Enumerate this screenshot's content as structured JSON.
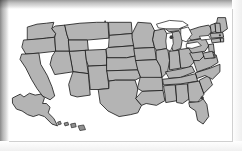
{
  "image": {
    "kind": "raster-map-image",
    "subject": "United States of America political map",
    "alt_text": "Gray map of the United States showing all state boundaries, with Alaska and Hawaii insets",
    "width": 242,
    "height": 151
  },
  "frame": {
    "style": "beveled-gray-shadow-border",
    "shadow_color": "#8a8a8a",
    "canvas_color": "#ffffff"
  },
  "palette": {
    "state_fill": "#b4b4b4",
    "state_border": "#1f1f1f",
    "lake_fill": "#ffffff",
    "island_fill": "#909090",
    "background": "#ffffff",
    "frame_dark": "#8a8a8a",
    "frame_light": "#dedede"
  },
  "map": {
    "title": "",
    "projection_note": "contiguous-48-with-insets",
    "insets": [
      {
        "name": "alaska-inset",
        "label": ""
      },
      {
        "name": "hawaii-inset",
        "label": ""
      }
    ],
    "features": {
      "states_shown": 50,
      "great_lakes_shown": true,
      "labels_shown": false,
      "legend_shown": false,
      "borders_visible": true
    }
  },
  "geometry": {
    "contiguous": [
      {
        "name": "washington",
        "d": "M34,22 L44,19 L54,18 L62,17 L60,24 L64,29 L63,33 L54,34 L44,35 L34,36 Z"
      },
      {
        "name": "oregon",
        "d": "M30,36 L44,35 L54,34 L63,33 L64,48 L46,50 L32,51 L28,44 Z"
      },
      {
        "name": "california",
        "d": "M28,51 L32,51 L46,50 L48,62 L55,74 L60,86 L63,96 L58,100 L50,96 L44,88 L38,78 L32,66 L26,57 Z"
      },
      {
        "name": "idaho",
        "d": "M64,21 L74,20 L76,30 L78,36 L79,48 L64,48 L63,33 L64,29 L60,24 Z"
      },
      {
        "name": "nevada",
        "d": "M64,48 L79,48 L83,70 L63,73 L58,62 L60,54 Z"
      },
      {
        "name": "utah",
        "d": "M79,48 L96,47 L97,58 L99,72 L83,70 Z"
      },
      {
        "name": "arizona",
        "d": "M83,70 L99,72 L101,95 L87,97 L80,95 L78,84 Z"
      },
      {
        "name": "montana",
        "d": "M74,20 L90,18 L108,17 L120,17 L121,34 L98,36 L78,36 L76,30 Z"
      },
      {
        "name": "wyoming",
        "d": "M78,36 L98,36 L99,47 L96,47 L79,48 Z"
      },
      {
        "name": "colorado",
        "d": "M96,47 L118,46 L119,63 L99,64 L97,58 Z"
      },
      {
        "name": "new-mexico",
        "d": "M99,64 L119,63 L121,88 L110,89 L101,89 L100,78 Z"
      },
      {
        "name": "north-dakota",
        "d": "M121,17 L145,17 L146,29 L122,31 Z"
      },
      {
        "name": "south-dakota",
        "d": "M122,31 L146,29 L148,42 L121,44 Z"
      },
      {
        "name": "nebraska",
        "d": "M121,44 L148,42 L150,53 L140,55 L119,55 L118,46 Z"
      },
      {
        "name": "kansas",
        "d": "M119,55 L140,55 L150,53 L152,68 L119,69 Z"
      },
      {
        "name": "oklahoma",
        "d": "M119,69 L152,68 L155,76 L149,79 L128,79 L121,80 Z"
      },
      {
        "name": "texas",
        "d": "M110,89 L121,88 L121,80 L128,79 L149,79 L152,88 L150,99 L156,106 L152,114 L144,116 L132,118 L120,112 L112,104 Z"
      },
      {
        "name": "minnesota",
        "d": "M146,29 L152,17 L166,18 L170,26 L168,36 L170,44 L148,45 L146,34 Z"
      },
      {
        "name": "iowa",
        "d": "M148,45 L170,44 L172,57 L150,58 Z"
      },
      {
        "name": "missouri",
        "d": "M150,58 L172,57 L176,64 L178,76 L158,78 L155,76 L152,68 Z"
      },
      {
        "name": "arkansas",
        "d": "M155,76 L178,76 L179,90 L157,91 L152,88 Z"
      },
      {
        "name": "louisiana",
        "d": "M157,91 L179,90 L181,101 L172,106 L161,104 L156,106 L150,99 Z"
      },
      {
        "name": "wisconsin",
        "d": "M170,26 L180,24 L186,34 L184,45 L172,47 L170,44 L168,36 Z"
      },
      {
        "name": "illinois",
        "d": "M172,47 L184,45 L186,58 L184,70 L178,76 L176,64 L172,57 Z"
      },
      {
        "name": "michigan-lp",
        "d": "M188,28 L196,26 L200,34 L198,45 L190,48 L186,38 Z"
      },
      {
        "name": "michigan-up",
        "d": "M178,21 L192,19 L200,22 L196,26 L186,27 Z"
      },
      {
        "name": "indiana",
        "d": "M186,48 L196,47 L198,66 L186,68 L186,58 Z"
      },
      {
        "name": "ohio",
        "d": "M198,46 L212,44 L214,58 L206,66 L198,66 L196,47 Z"
      },
      {
        "name": "kentucky",
        "d": "M182,70 L198,67 L210,64 L213,70 L198,76 L186,77 Z"
      },
      {
        "name": "tennessee",
        "d": "M179,78 L198,76 L214,72 L216,80 L198,83 L180,84 Z"
      },
      {
        "name": "mississippi",
        "d": "M180,85 L192,84 L194,101 L182,103 L181,94 Z"
      },
      {
        "name": "alabama",
        "d": "M193,84 L205,83 L207,99 L200,104 L194,103 Z"
      },
      {
        "name": "georgia",
        "d": "M206,82 L218,80 L223,94 L216,103 L207,102 L206,92 Z"
      },
      {
        "name": "florida",
        "d": "M207,103 L218,102 L222,99 L226,105 L228,118 L222,126 L216,122 L214,112 L208,108 Z"
      },
      {
        "name": "south-carolina",
        "d": "M218,79 L228,74 L232,84 L223,93 Z"
      },
      {
        "name": "north-carolina",
        "d": "M214,71 L230,66 L240,62 L240,70 L232,78 L224,74 L216,77 Z"
      },
      {
        "name": "virginia",
        "d": "M212,58 L226,52 L236,52 L238,60 L230,65 L216,70 Z"
      },
      {
        "name": "west-virginia",
        "d": "M208,50 L218,46 L224,52 L218,58 L212,58 Z"
      },
      {
        "name": "pennsylvania",
        "d": "M206,37 L224,34 L228,42 L224,48 L210,50 L206,44 Z"
      },
      {
        "name": "new-york",
        "d": "M206,26 L218,22 L228,20 L232,26 L226,33 L210,36 L206,34 Z"
      },
      {
        "name": "maine",
        "d": "M238,12 L246,12 L248,24 L242,28 L236,22 Z"
      },
      {
        "name": "vermont",
        "d": "M230,20 L235,18 L236,27 L231,28 Z"
      },
      {
        "name": "new-hampshire",
        "d": "M235,18 L240,18 L241,28 L236,28 Z"
      },
      {
        "name": "massachusetts",
        "d": "M230,29 L243,28 L244,33 L231,34 Z"
      },
      {
        "name": "connecticut",
        "d": "M231,35 L240,34 L241,38 L232,39 Z"
      },
      {
        "name": "rhode-island",
        "d": "M241,34 L244,34 L244,38 L241,38 Z"
      },
      {
        "name": "new-jersey",
        "d": "M228,41 L233,40 L234,49 L229,50 Z"
      },
      {
        "name": "delaware",
        "d": "M230,50 L234,49 L235,55 L231,55 Z"
      },
      {
        "name": "maryland",
        "d": "M222,50 L232,48 L234,55 L224,56 Z"
      }
    ],
    "lakes": [
      {
        "name": "lake-superior",
        "d": "M172,19 L186,15 L200,16 L206,20 L196,24 L182,24 L174,23 Z"
      },
      {
        "name": "lake-michigan",
        "d": "M183,29 L189,28 L190,40 L187,48 L183,46 L182,37 Z"
      },
      {
        "name": "lake-huron",
        "d": "M198,24 L206,22 L210,30 L204,38 L199,36 L198,30 Z"
      },
      {
        "name": "lake-erie",
        "d": "M204,40 L216,38 L220,42 L210,45 L204,44 Z"
      },
      {
        "name": "lake-ontario",
        "d": "M218,32 L228,31 L230,35 L220,36 Z"
      }
    ],
    "alaska": {
      "name": "alaska",
      "d": "M18,98 L26,94 L30,97 L36,93 L42,95 L48,94 L52,98 L50,104 L54,104 L58,108 L56,114 L62,120 L66,128 L60,126 L52,118 L46,116 L40,118 L34,116 L28,112 L22,110 L18,104 Z"
    },
    "hawaii": [
      {
        "name": "hawaii-kauai",
        "d": "M66,124 L69,123 L70,126 L67,127 Z"
      },
      {
        "name": "hawaii-oahu",
        "d": "M73,125 L77,124 L78,127 L74,128 Z"
      },
      {
        "name": "hawaii-maui",
        "d": "M80,126 L85,125 L86,129 L81,130 Z"
      },
      {
        "name": "hawaii-big-island",
        "d": "M88,128 L94,127 L96,132 L90,133 Z"
      }
    ],
    "markers": [
      {
        "name": "map-dot-michigan",
        "cx": 188,
        "cy": 33,
        "r": 2.0
      },
      {
        "name": "map-dot-georgia-coast",
        "cx": 221,
        "cy": 98,
        "r": 1.8
      },
      {
        "name": "map-dot-massachusetts",
        "cx": 240,
        "cy": 31,
        "r": 1.2
      },
      {
        "name": "map-dot-montana-top",
        "cx": 117,
        "cy": 16,
        "r": 1.0
      }
    ]
  }
}
